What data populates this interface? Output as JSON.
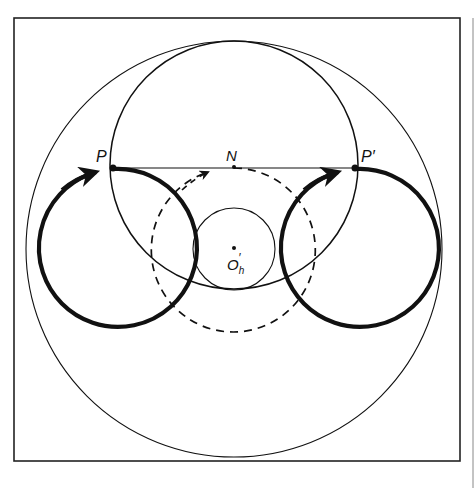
{
  "figure": {
    "labels": {
      "P": "P",
      "P_prime": "P′",
      "N": "N",
      "O_h_prime_main": "O",
      "O_h_prime_sub": "h",
      "O_h_prime_prime": "′"
    },
    "colors": {
      "ink": "#111111",
      "background": "#ffffff",
      "frame": "#222222"
    },
    "elements": [
      {
        "name": "frame",
        "type": "rect",
        "x": 14,
        "y": 18,
        "w": 446,
        "h": 443
      },
      {
        "name": "outer-circle",
        "type": "circle",
        "cx": 234,
        "cy": 249,
        "r": 208,
        "style": "thin"
      },
      {
        "name": "inner-large-circle",
        "type": "circle",
        "cx": 234,
        "cy": 165,
        "r": 124,
        "style": "medium"
      },
      {
        "name": "small-circle",
        "type": "circle",
        "cx": 234,
        "cy": 249,
        "r": 41,
        "style": "thin",
        "center_label": "O′h"
      },
      {
        "name": "dashed-circle",
        "type": "circle",
        "cx": 234,
        "cy": 250,
        "r": 82,
        "style": "dashed"
      },
      {
        "name": "left-heavy-circle",
        "type": "circle",
        "cx": 114,
        "cy": 248,
        "r": 79,
        "style": "heavy"
      },
      {
        "name": "right-heavy-circle",
        "type": "circle",
        "cx": 356,
        "cy": 248,
        "r": 79,
        "style": "heavy"
      },
      {
        "name": "chord-PP'",
        "type": "line",
        "from": "P",
        "to": "P′"
      }
    ],
    "points": {
      "P": [
        113,
        169
      ],
      "P_prime": [
        355,
        169
      ],
      "N": [
        234,
        167
      ],
      "O_h_prime": [
        234,
        248
      ]
    }
  }
}
